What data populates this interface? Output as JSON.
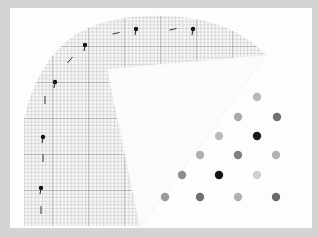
{
  "image": {
    "description": "Photo of abstract artwork: quarter-circle of graph paper with dashed arc of black dot markers, overlapped by a white triangular wedge, and a triangular lattice of gray-scale dots at lower right",
    "frame_color": "#d4d4d4",
    "page_color": "#fdfdfd",
    "grid_color": "#9a9a9a",
    "grid_major_color": "#6e6e6e"
  },
  "arc_markers": [
    {
      "type": "dot",
      "x": 41,
      "y": 188
    },
    {
      "type": "dash",
      "x": 41,
      "y": 210
    },
    {
      "type": "dot",
      "x": 43,
      "y": 137
    },
    {
      "type": "dash",
      "x": 43,
      "y": 158
    },
    {
      "type": "dash",
      "x": 45,
      "y": 100
    },
    {
      "type": "dot",
      "x": 55,
      "y": 82
    },
    {
      "type": "dash",
      "x": 70,
      "y": 60
    },
    {
      "type": "dot",
      "x": 85,
      "y": 45
    },
    {
      "type": "dash",
      "x": 116,
      "y": 33
    },
    {
      "type": "dot",
      "x": 136,
      "y": 29
    },
    {
      "type": "dash",
      "x": 173,
      "y": 29
    },
    {
      "type": "dot",
      "x": 193,
      "y": 29
    }
  ],
  "lattice_dots": [
    {
      "x": 257,
      "y": 97,
      "shade": "#b8b8b8"
    },
    {
      "x": 238,
      "y": 117,
      "shade": "#aaaaaa"
    },
    {
      "x": 277,
      "y": 117,
      "shade": "#707070"
    },
    {
      "x": 219,
      "y": 136,
      "shade": "#bdbdbd"
    },
    {
      "x": 257,
      "y": 136,
      "shade": "#1a1a1a"
    },
    {
      "x": 200,
      "y": 155,
      "shade": "#b0b0b0"
    },
    {
      "x": 238,
      "y": 155,
      "shade": "#808080"
    },
    {
      "x": 276,
      "y": 155,
      "shade": "#b4b4b4"
    },
    {
      "x": 182,
      "y": 175,
      "shade": "#8e8e8e"
    },
    {
      "x": 219,
      "y": 175,
      "shade": "#141414"
    },
    {
      "x": 257,
      "y": 175,
      "shade": "#cfcfcf"
    },
    {
      "x": 165,
      "y": 197,
      "shade": "#999999"
    },
    {
      "x": 200,
      "y": 197,
      "shade": "#707070"
    },
    {
      "x": 238,
      "y": 197,
      "shade": "#b0b0b0"
    },
    {
      "x": 276,
      "y": 197,
      "shade": "#6a6a6a"
    }
  ]
}
